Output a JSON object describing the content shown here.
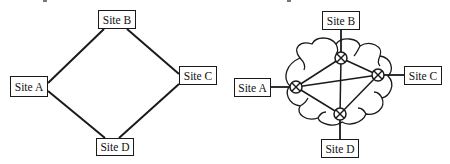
{
  "diagrams": [
    {
      "name": "point-to-point-network",
      "sites": [
        {
          "id": "A",
          "label": "Site A",
          "x": 10,
          "y": 76,
          "w": 38,
          "h": 21
        },
        {
          "id": "B",
          "label": "Site B",
          "x": 98,
          "y": 10,
          "w": 38,
          "h": 19
        },
        {
          "id": "C",
          "label": "Site C",
          "x": 179,
          "y": 66,
          "w": 38,
          "h": 19
        },
        {
          "id": "D",
          "label": "Site D",
          "x": 96,
          "y": 138,
          "w": 38,
          "h": 18
        }
      ],
      "links": [
        [
          "A",
          "B"
        ],
        [
          "B",
          "C"
        ],
        [
          "A",
          "D"
        ],
        [
          "D",
          "C"
        ]
      ]
    },
    {
      "name": "cloud-network",
      "sites": [
        {
          "id": "A",
          "label": "Site A",
          "x": 234,
          "y": 78,
          "w": 37,
          "h": 19
        },
        {
          "id": "B",
          "label": "Site B",
          "x": 322,
          "y": 11,
          "w": 38,
          "h": 19
        },
        {
          "id": "C",
          "label": "Site C",
          "x": 404,
          "y": 66,
          "w": 38,
          "h": 19
        },
        {
          "id": "D",
          "label": "Site D",
          "x": 321,
          "y": 139,
          "w": 38,
          "h": 19
        }
      ],
      "routers": [
        {
          "id": "rA",
          "cx": 296,
          "cy": 87
        },
        {
          "id": "rB",
          "cx": 341,
          "cy": 58
        },
        {
          "id": "rC",
          "cx": 378,
          "cy": 75
        },
        {
          "id": "rD",
          "cx": 340,
          "cy": 114
        }
      ],
      "router_links": [
        [
          "rA",
          "rB"
        ],
        [
          "rB",
          "rC"
        ],
        [
          "rA",
          "rC"
        ],
        [
          "rA",
          "rD"
        ],
        [
          "rC",
          "rD"
        ],
        [
          "rB",
          "rD"
        ]
      ]
    }
  ],
  "colors": {
    "line": "#1a1a1a",
    "background": "#ffffff"
  }
}
